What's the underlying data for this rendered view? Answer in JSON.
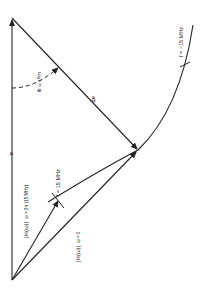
{
  "diagram": {
    "type": "phasor-diagram",
    "orientation": "rotated 90deg clockwise",
    "labels": {
      "vertical_axis": "a",
      "hypotenuse": "ab",
      "angle": "ω₀τ = φ",
      "vector_dc_mag": "|H(ω)|",
      "vector_dc_sub": "ω = 0",
      "vector_15_mag": "|H(ω)|",
      "vector_15_sub": "ω = 2π (15 MHz)",
      "tick_pos": "f = 15 MHz",
      "tick_neg": "f = −15 MHz"
    },
    "colors": {
      "ink": "#222222",
      "background": "#ffffff"
    }
  }
}
